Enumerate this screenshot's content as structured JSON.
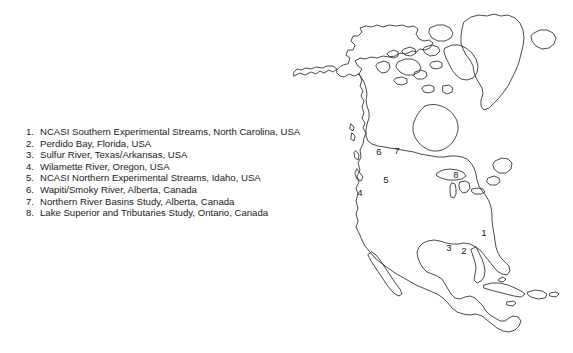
{
  "figure": {
    "background_color": "#ffffff",
    "line_color": "#2b2b2b",
    "text_color": "#1a1a1a"
  },
  "legend": {
    "items": [
      {
        "num": "1.",
        "label": "NCASI Southern Experimental Streams, North Carolina, USA"
      },
      {
        "num": "2.",
        "label": "Perdido Bay, Florida, USA"
      },
      {
        "num": "3.",
        "label": "Sulfur River, Texas/Arkansas, USA"
      },
      {
        "num": "4.",
        "label": "Wilamette River, Oregon, USA"
      },
      {
        "num": "5.",
        "label": "NCASI Northern Experimental Streams, Idaho, USA"
      },
      {
        "num": "6.",
        "label": "Wapiti/Smoky River, Alberta, Canada"
      },
      {
        "num": "7.",
        "label": "Northern River Basins Study, Alberta, Canada"
      },
      {
        "num": "8.",
        "label": "Lake Superior and Tributaries Study, Ontario, Canada"
      }
    ]
  },
  "map": {
    "region": "North America",
    "markers": [
      {
        "id": "1",
        "label": "1",
        "x": 484,
        "y": 233
      },
      {
        "id": "2",
        "label": "2",
        "x": 464,
        "y": 251
      },
      {
        "id": "3",
        "label": "3",
        "x": 449,
        "y": 248
      },
      {
        "id": "4",
        "label": "4",
        "x": 360,
        "y": 193
      },
      {
        "id": "5",
        "label": "5",
        "x": 386,
        "y": 180
      },
      {
        "id": "6",
        "label": "6",
        "x": 379,
        "y": 152
      },
      {
        "id": "7",
        "label": "7",
        "x": 397,
        "y": 151
      },
      {
        "id": "8",
        "label": "8",
        "x": 456,
        "y": 175
      }
    ]
  }
}
